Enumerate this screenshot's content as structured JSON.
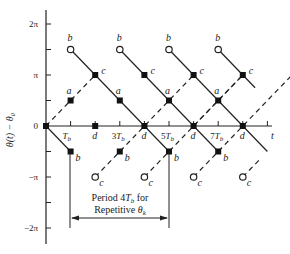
{
  "figure": {
    "y_axis_label": "θ(t) − θ₀",
    "x_axis_label": "t",
    "y_ticks": [
      {
        "label": "2π",
        "value": 2
      },
      {
        "label": "",
        "value": 1.5
      },
      {
        "label": "π",
        "value": 1
      },
      {
        "label": "",
        "value": 0.5
      },
      {
        "label": "0",
        "value": 0
      },
      {
        "label": "",
        "value": -0.5
      },
      {
        "label": "−π",
        "value": -1
      },
      {
        "label": "",
        "value": -1.5
      },
      {
        "label": "−2π",
        "value": -2
      }
    ],
    "x_ticks": [
      {
        "label": "T_b",
        "value": 1
      },
      {
        "label": "d",
        "value": 2
      },
      {
        "label": "3T_b",
        "value": 3
      },
      {
        "label": "d",
        "value": 4
      },
      {
        "label": "5T_b",
        "value": 5
      },
      {
        "label": "d",
        "value": 6
      },
      {
        "label": "7T_b",
        "value": 7
      },
      {
        "label": "d",
        "value": 8
      },
      {
        "label": "",
        "value": 9
      }
    ],
    "point_labels": [
      "a",
      "b",
      "c",
      "d"
    ],
    "annotation": {
      "line1": "Period 4T_b for",
      "line2": "Repetitive θ_k",
      "from_x": 1,
      "to_x": 5
    }
  }
}
